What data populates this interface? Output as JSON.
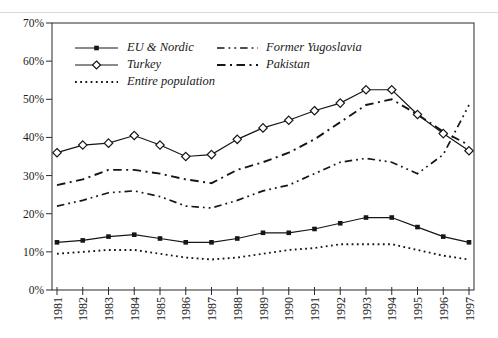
{
  "figure": {
    "background": "#ffffff",
    "scan_artifact_line_color": "#d9d9d9"
  },
  "chart_data": {
    "type": "line",
    "title": "",
    "xlabel": "",
    "ylabel": "",
    "x_categories": [
      "1981",
      "1982",
      "1983",
      "1984",
      "1985",
      "1986",
      "1987",
      "1988",
      "1989",
      "1990",
      "1991",
      "1992",
      "1993",
      "1994",
      "1995",
      "1996",
      "1997"
    ],
    "y_ticks": [
      "0%",
      "10%",
      "20%",
      "30%",
      "40%",
      "50%",
      "60%",
      "70%"
    ],
    "ylim": [
      0,
      70
    ],
    "grid": false,
    "legend_position": "top-left-inside",
    "line_color": "#161616",
    "axis_color": "#2b2b2b",
    "series": [
      {
        "name": "EU & Nordic",
        "line_style": "solid",
        "marker": "filled-square",
        "values": [
          12.5,
          13,
          14,
          14.5,
          13.5,
          12.5,
          12.5,
          13.5,
          15,
          15,
          16,
          17.5,
          19,
          19,
          16.5,
          14,
          12.5
        ]
      },
      {
        "name": "Turkey",
        "line_style": "solid",
        "marker": "open-diamond",
        "values": [
          36,
          38,
          38.5,
          40.5,
          38,
          35,
          35.5,
          39.5,
          42.5,
          44.5,
          47,
          49,
          52.5,
          52.5,
          46,
          41,
          36.5
        ]
      },
      {
        "name": "Entire population",
        "line_style": "dotted",
        "marker": "none",
        "values": [
          9.5,
          10,
          10.5,
          10.5,
          9.5,
          8.5,
          8,
          8.5,
          9.5,
          10.5,
          11,
          12,
          12,
          12,
          10.5,
          9,
          8
        ]
      },
      {
        "name": "Former Yugoslavia",
        "line_style": "dash-dot-dot",
        "marker": "none",
        "values": [
          22,
          23.5,
          25.5,
          26,
          24.5,
          22,
          21.5,
          23.5,
          26,
          27.5,
          30.5,
          33.5,
          34.5,
          33.5,
          30.5,
          35.5,
          48.5
        ]
      },
      {
        "name": "Pakistan",
        "line_style": "dash-dot",
        "marker": "none",
        "values": [
          27.5,
          29,
          31.5,
          31.5,
          30.5,
          29,
          28,
          31.5,
          33.5,
          36,
          39.5,
          44,
          48.5,
          50,
          46,
          41.5,
          38
        ]
      }
    ]
  }
}
